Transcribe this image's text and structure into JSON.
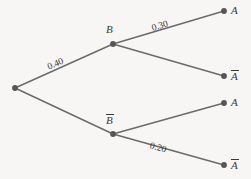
{
  "figure": {
    "type": "probability-tree-diagram",
    "background_color": "#f7f6f4",
    "line_color": "#6a6a6a",
    "text_color": "#3a3a3a"
  },
  "nodes": {
    "root": {
      "label": "",
      "x": 15,
      "y": 88
    },
    "branch_upper": {
      "label": "B",
      "overbar": false,
      "x": 113,
      "y": 44,
      "label_x": 106,
      "label_y": 24
    },
    "branch_lower": {
      "label": "B",
      "overbar": true,
      "x": 113,
      "y": 134,
      "label_x": 106,
      "label_y": 114
    }
  },
  "leaves": [
    {
      "label": "A",
      "overbar": false,
      "x": 224,
      "y": 11,
      "label_x": 231,
      "label_y": 5
    },
    {
      "label": "A",
      "overbar": true,
      "x": 224,
      "y": 76,
      "label_x": 231,
      "label_y": 70
    },
    {
      "label": "A",
      "overbar": false,
      "x": 224,
      "y": 103,
      "label_x": 231,
      "label_y": 97
    },
    {
      "label": "A",
      "overbar": true,
      "x": 224,
      "y": 165,
      "label_x": 231,
      "label_y": 159
    }
  ],
  "edges": [
    {
      "from": "root",
      "to": "branch_upper",
      "probability": "0.40"
    },
    {
      "from": "root",
      "to": "branch_lower",
      "probability": ""
    },
    {
      "from": "branch_upper",
      "to": "leaf_1",
      "probability": "0.30"
    },
    {
      "from": "branch_upper",
      "to": "leaf_2",
      "probability": ""
    },
    {
      "from": "branch_lower",
      "to": "leaf_3",
      "probability": ""
    },
    {
      "from": "branch_lower",
      "to": "leaf_4",
      "probability": "0.20"
    }
  ],
  "probability_labels": [
    {
      "text": "0.40",
      "x": 48,
      "y": 63,
      "rotation": -24
    },
    {
      "text": "0.30",
      "x": 152,
      "y": 24,
      "rotation": -17
    },
    {
      "text": "0.20",
      "x": 150,
      "y": 141,
      "rotation": 17
    }
  ]
}
